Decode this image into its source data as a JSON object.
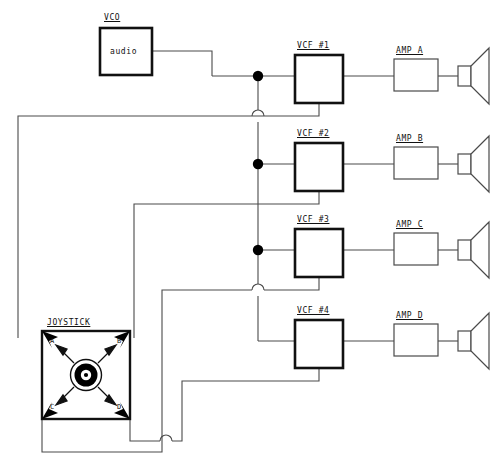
{
  "diagram": {
    "title_visible": false,
    "source": {
      "label": "VCO",
      "body_text": "audio",
      "box": {
        "x": 100,
        "y": 28,
        "w": 52,
        "h": 47
      }
    },
    "filters": [
      {
        "label": "VCF #1",
        "box": {
          "x": 295,
          "y": 55,
          "w": 48,
          "h": 48
        },
        "input_y": 76,
        "ctrl_drop_y": 116
      },
      {
        "label": "VCF #2",
        "box": {
          "x": 295,
          "y": 143,
          "w": 48,
          "h": 48
        },
        "input_y": 164,
        "ctrl_drop_y": 204
      },
      {
        "label": "VCF #3",
        "box": {
          "x": 295,
          "y": 229,
          "w": 48,
          "h": 48
        },
        "input_y": 250,
        "ctrl_drop_y": 290
      },
      {
        "label": "VCF #4",
        "box": {
          "x": 295,
          "y": 320,
          "w": 48,
          "h": 48
        },
        "input_y": 341,
        "ctrl_drop_y": 381
      }
    ],
    "amps": [
      {
        "label": "AMP A",
        "box": {
          "x": 394,
          "y": 59,
          "w": 44,
          "h": 32
        },
        "speaker_y": 76
      },
      {
        "label": "AMP B",
        "box": {
          "x": 394,
          "y": 147,
          "w": 44,
          "h": 32
        },
        "speaker_y": 164
      },
      {
        "label": "AMP C",
        "box": {
          "x": 394,
          "y": 233,
          "w": 44,
          "h": 32
        },
        "speaker_y": 250
      },
      {
        "label": "AMP D",
        "box": {
          "x": 394,
          "y": 324,
          "w": 44,
          "h": 32
        },
        "speaker_y": 341
      }
    ],
    "bus": {
      "x": 258,
      "top_y": 76,
      "bottom_y": 341,
      "junction_dots_y": [
        76,
        164,
        250
      ],
      "hop_y": [
        116,
        290
      ]
    },
    "joystick": {
      "label": "JOYSTICK",
      "box": {
        "x": 42,
        "y": 331,
        "w": 88,
        "h": 88
      },
      "corner_labels": [
        "A",
        "B",
        "C",
        "D"
      ],
      "knob": {
        "cx": 86,
        "cy": 375,
        "r_outer": 16,
        "r_ring": 12,
        "r_inner": 6,
        "r_dot": 2
      },
      "arrow_count": 4,
      "corner_arrowheads": 4
    },
    "colors": {
      "wire": "#4a4a4a",
      "box_stroke": "#111111",
      "fill": "#ffffff",
      "node_dot": "#000000",
      "arrow_fill": "#000000",
      "text": "#111111"
    }
  }
}
